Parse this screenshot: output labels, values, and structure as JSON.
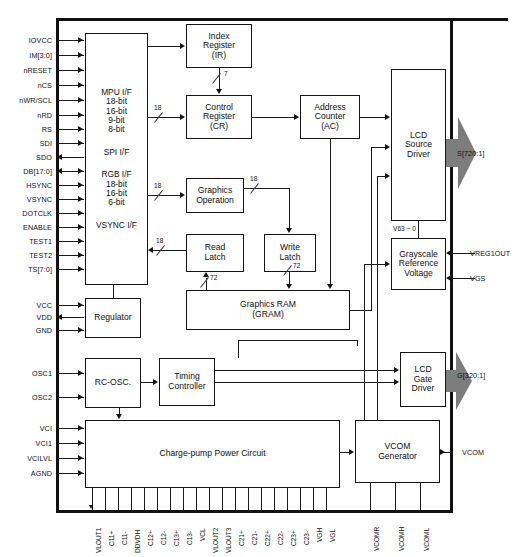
{
  "diagram": {
    "blocks": {
      "mpu_if": {
        "lines": [
          "MPU I/F",
          "18-bit",
          "16-bit",
          "9-bit",
          "8-bit",
          "SPI I/F",
          "RGB I/F",
          "18-bit",
          "16-bit",
          "6-bit",
          "VSYNC I/F"
        ]
      },
      "index_reg": {
        "lines": [
          "Index",
          "Register",
          "(IR)"
        ]
      },
      "control_reg": {
        "lines": [
          "Control",
          "Register",
          "(CR)"
        ]
      },
      "addr_counter": {
        "lines": [
          "Address",
          "Counter",
          "(AC)"
        ]
      },
      "graphics_op": {
        "lines": [
          "Graphics",
          "Operation"
        ]
      },
      "read_latch": {
        "lines": [
          "Read",
          "Latch"
        ]
      },
      "write_latch": {
        "lines": [
          "Write",
          "Latch"
        ]
      },
      "gram": {
        "lines": [
          "Graphics RAM",
          "(GRAM)"
        ]
      },
      "lcd_source": {
        "lines": [
          "LCD",
          "Source",
          "Driver"
        ]
      },
      "grayscale": {
        "lines": [
          "Grayscale",
          "Reference",
          "Voltage"
        ]
      },
      "regulator": {
        "lines": [
          "Regulator"
        ]
      },
      "rc_osc": {
        "lines": [
          "RC-OSC."
        ]
      },
      "timing_ctrl": {
        "lines": [
          "Timing",
          "Controller"
        ]
      },
      "lcd_gate": {
        "lines": [
          "LCD",
          "Gate",
          "Driver"
        ]
      },
      "charge_pump": {
        "lines": [
          "Charge-pump Power Circuit"
        ]
      },
      "vcom_gen": {
        "lines": [
          "VCOM",
          "Generator"
        ]
      }
    },
    "left_pins": [
      {
        "name": "IOVCC",
        "dir": "in"
      },
      {
        "name": "IM[3:0]",
        "dir": "in"
      },
      {
        "name": "nRESET",
        "dir": "in"
      },
      {
        "name": "nCS",
        "dir": "in"
      },
      {
        "name": "nWR/SCL",
        "dir": "in"
      },
      {
        "name": "nRD",
        "dir": "in"
      },
      {
        "name": "RS",
        "dir": "in"
      },
      {
        "name": "SDI",
        "dir": "in"
      },
      {
        "name": "SDO",
        "dir": "out"
      },
      {
        "name": "DB[17:0]",
        "dir": "bi"
      },
      {
        "name": "HSYNC",
        "dir": "in"
      },
      {
        "name": "VSYNC",
        "dir": "in"
      },
      {
        "name": "DOTCLK",
        "dir": "in"
      },
      {
        "name": "ENABLE",
        "dir": "in"
      },
      {
        "name": "TEST1",
        "dir": "in"
      },
      {
        "name": "TEST2",
        "dir": "in"
      },
      {
        "name": "TS[7:0]",
        "dir": "in"
      }
    ],
    "power_pins": [
      {
        "name": "VCC",
        "dir": "in"
      },
      {
        "name": "VDD",
        "dir": "out"
      },
      {
        "name": "GND",
        "dir": "in"
      }
    ],
    "osc_pins": [
      {
        "name": "OSC1",
        "dir": "in"
      },
      {
        "name": "OSC2",
        "dir": "in"
      }
    ],
    "analog_pins": [
      {
        "name": "VCI",
        "dir": "in"
      },
      {
        "name": "VCI1",
        "dir": "in"
      },
      {
        "name": "VCILVL",
        "dir": "in"
      },
      {
        "name": "AGND",
        "dir": "in"
      }
    ],
    "right_pins": [
      {
        "name": "S[720:1]",
        "dir": "out"
      },
      {
        "name": "VREG1OUT",
        "dir": "in"
      },
      {
        "name": "VGS",
        "dir": "in"
      },
      {
        "name": "G[320:1]",
        "dir": "out"
      },
      {
        "name": "VCOM",
        "dir": "out"
      }
    ],
    "bottom_pins": [
      "VLOUT1",
      "C11+",
      "C11-",
      "DDVDH",
      "C12+",
      "C12-",
      "C13+",
      "C13-",
      "VCL",
      "VLOUT2",
      "VLOUT3",
      "C21+",
      "C21-",
      "C22+",
      "C22-",
      "C23+",
      "C23-",
      "VGH",
      "VGL"
    ],
    "bottom_pins_right": [
      "VCOMR",
      "VCOMH",
      "VCOML"
    ],
    "bus_widths": {
      "ir_to_cr": "7",
      "mpu_to_cr": "18",
      "mpu_to_gop": "18",
      "mpu_to_readlatch": "18",
      "gop_to_writelatch": "18",
      "readlatch_to_gram": "72",
      "writelatch_to_gram": "72"
    },
    "annotations": {
      "grayscale_range": "V63 ~ 0"
    },
    "colors": {
      "line": "#141414",
      "fill": "#ffffff",
      "fat_arrow": "#7d7d7d"
    }
  }
}
